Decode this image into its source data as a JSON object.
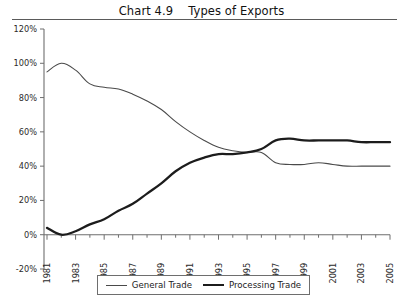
{
  "title": {
    "full": "Chart 4.9    Types of Exports",
    "number": "Chart 4.9",
    "text": "Types of Exports"
  },
  "legend": {
    "position": "bottom-center",
    "entries": [
      {
        "label": "General Trade",
        "style": "thin-line",
        "color": "#4a4a4a"
      },
      {
        "label": "Processing Trade",
        "style": "thick-line",
        "color": "#1c1c1c"
      }
    ]
  },
  "axes": {
    "y_ticks": [
      "120%",
      "100%",
      "80%",
      "60%",
      "40%",
      "20%",
      "0%",
      "-20%"
    ],
    "x_ticks": [
      "1981",
      "1983",
      "1985",
      "1987",
      "1989",
      "1991",
      "1993",
      "1995",
      "1997",
      "1999",
      "2001",
      "2003",
      "2005"
    ]
  },
  "chart_data": {
    "type": "line",
    "title": "Chart 4.9    Types of Exports",
    "xlabel": "",
    "ylabel": "",
    "ylim": [
      -20,
      120
    ],
    "xlim": [
      1981,
      2005
    ],
    "ytick_values": [
      -20,
      0,
      20,
      40,
      60,
      80,
      100,
      120
    ],
    "ytick_labels": [
      "-20%",
      "0%",
      "20%",
      "40%",
      "60%",
      "80%",
      "100%",
      "120%"
    ],
    "xtick_values": [
      1981,
      1983,
      1985,
      1987,
      1989,
      1991,
      1993,
      1995,
      1997,
      1999,
      2001,
      2003,
      2005
    ],
    "xtick_labels": [
      "1981",
      "1983",
      "1985",
      "1987",
      "1989",
      "1991",
      "1993",
      "1995",
      "1997",
      "1999",
      "2001",
      "2003",
      "2005"
    ],
    "xtick_rotation": 90,
    "minor_xticks_every_year": true,
    "grid": false,
    "legend_position": "bottom-center",
    "x": [
      1981,
      1982,
      1983,
      1984,
      1985,
      1986,
      1987,
      1988,
      1989,
      1990,
      1991,
      1992,
      1993,
      1994,
      1995,
      1996,
      1997,
      1998,
      1999,
      2000,
      2001,
      2002,
      2003,
      2004,
      2005
    ],
    "series": [
      {
        "name": "General Trade",
        "color": "#4a4a4a",
        "line_width": "thin",
        "values": [
          95,
          100,
          96,
          88,
          86,
          85,
          82,
          78,
          73,
          66,
          60,
          55,
          51,
          49,
          48,
          48,
          42,
          41,
          41,
          42,
          41,
          40,
          40,
          40,
          40
        ]
      },
      {
        "name": "Processing Trade",
        "color": "#1c1c1c",
        "line_width": "thick",
        "values": [
          4,
          0,
          2,
          6,
          9,
          14,
          18,
          24,
          30,
          37,
          42,
          45,
          47,
          47,
          48,
          50,
          55,
          56,
          55,
          55,
          55,
          55,
          54,
          54,
          54
        ]
      }
    ]
  }
}
